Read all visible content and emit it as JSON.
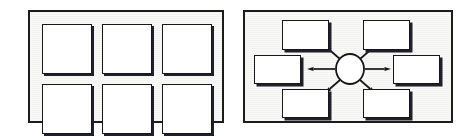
{
  "figure": {
    "caption": "",
    "background_color": "#ffffff",
    "panel_fill": "#f3f3f1",
    "line_color": "#17171a",
    "shape_fill": "#ffffff",
    "shadow_color": "#20202a"
  },
  "panels": [
    {
      "id": "grid-panel",
      "name": "grid-of-squares-panel",
      "label": "",
      "layout": "3x2 grid",
      "x": 28,
      "y": 10,
      "width": 196,
      "height": 113,
      "shapes": [
        {
          "name": "grid-square-1",
          "label": "",
          "x": 12,
          "y": 12,
          "width": 50,
          "height": 50
        },
        {
          "name": "grid-square-2",
          "label": "",
          "x": 72,
          "y": 12,
          "width": 50,
          "height": 50
        },
        {
          "name": "grid-square-3",
          "label": "",
          "x": 132,
          "y": 12,
          "width": 50,
          "height": 50
        },
        {
          "name": "grid-square-4",
          "label": "",
          "x": 12,
          "y": 72,
          "width": 50,
          "height": 50
        },
        {
          "name": "grid-square-5",
          "label": "",
          "x": 72,
          "y": 72,
          "width": 50,
          "height": 50
        },
        {
          "name": "grid-square-6",
          "label": "",
          "x": 132,
          "y": 72,
          "width": 50,
          "height": 50
        }
      ]
    },
    {
      "id": "hub-panel",
      "name": "hub-and-spoke-panel",
      "label": "",
      "layout": "central circle with six radiating boxes",
      "x": 243,
      "y": 10,
      "width": 210,
      "height": 113,
      "hub": {
        "name": "hub-node",
        "label": "",
        "cx": 105,
        "cy": 57,
        "rx": 14,
        "ry": 15
      },
      "shapes": [
        {
          "name": "hub-box-top-left",
          "label": "",
          "x": 37,
          "y": 8,
          "width": 47,
          "height": 30
        },
        {
          "name": "hub-box-top-right",
          "label": "",
          "x": 118,
          "y": 8,
          "width": 47,
          "height": 30
        },
        {
          "name": "hub-box-middle-left",
          "label": "",
          "x": 9,
          "y": 43,
          "width": 47,
          "height": 29
        },
        {
          "name": "hub-box-middle-right",
          "label": "",
          "x": 148,
          "y": 43,
          "width": 47,
          "height": 29
        },
        {
          "name": "hub-box-bottom-left",
          "label": "",
          "x": 37,
          "y": 77,
          "width": 47,
          "height": 29
        },
        {
          "name": "hub-box-bottom-right",
          "label": "",
          "x": 118,
          "y": 77,
          "width": 47,
          "height": 29
        }
      ],
      "arrows": [
        {
          "name": "arrow-to-top-left",
          "direction": "up-left",
          "from": "hub-node",
          "to": "hub-box-top-left",
          "x1": 95,
          "y1": 47,
          "x2": 80,
          "y2": 34
        },
        {
          "name": "arrow-to-top-right",
          "direction": "up-right",
          "from": "hub-node",
          "to": "hub-box-top-right",
          "x1": 115,
          "y1": 47,
          "x2": 130,
          "y2": 34
        },
        {
          "name": "arrow-to-middle-left",
          "direction": "left",
          "from": "hub-node",
          "to": "hub-box-middle-left",
          "x1": 90,
          "y1": 57,
          "x2": 62,
          "y2": 57
        },
        {
          "name": "arrow-to-middle-right",
          "direction": "right",
          "from": "hub-node",
          "to": "hub-box-middle-right",
          "x1": 120,
          "y1": 57,
          "x2": 146,
          "y2": 57
        },
        {
          "name": "arrow-to-bottom-left",
          "direction": "down-left",
          "from": "hub-node",
          "to": "hub-box-bottom-left",
          "x1": 95,
          "y1": 68,
          "x2": 80,
          "y2": 81
        },
        {
          "name": "arrow-to-bottom-right",
          "direction": "down-right",
          "from": "hub-node",
          "to": "hub-box-bottom-right",
          "x1": 115,
          "y1": 68,
          "x2": 130,
          "y2": 81
        }
      ]
    }
  ]
}
